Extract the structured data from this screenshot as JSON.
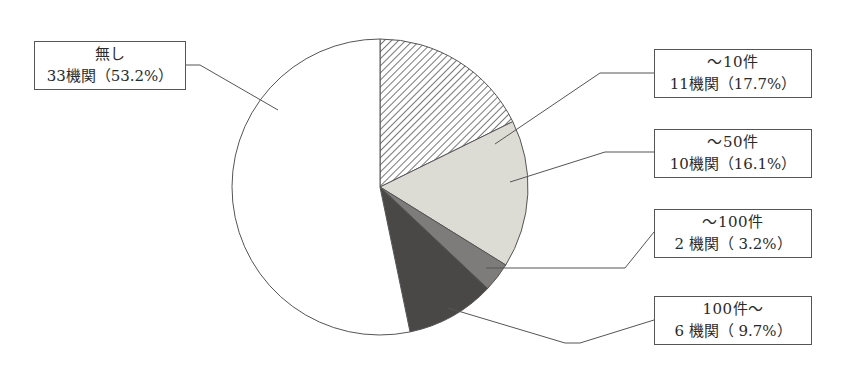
{
  "chart_data": {
    "type": "pie",
    "title": "",
    "start_angle_deg": 0,
    "direction": "clockwise",
    "slices": [
      {
        "label": "～10件",
        "count_text": "11機関（17.7%）",
        "count": 11,
        "percent": 17.7,
        "fill": "hatch",
        "color": "#ffffff"
      },
      {
        "label": "～50件",
        "count_text": "10機関（16.1%）",
        "count": 10,
        "percent": 16.1,
        "fill": "solid",
        "color": "#dcdcd4"
      },
      {
        "label": "～100件",
        "count_text": "2 機関（ 3.2%）",
        "count": 2,
        "percent": 3.2,
        "fill": "solid",
        "color": "#7e7c7b"
      },
      {
        "label": "100件～",
        "count_text": "6 機関（ 9.7%）",
        "count": 6,
        "percent": 9.7,
        "fill": "solid",
        "color": "#4a4747"
      },
      {
        "label": "無し",
        "count_text": "33機関（53.2%）",
        "count": 33,
        "percent": 53.2,
        "fill": "solid",
        "color": "#ffffff"
      }
    ],
    "total": 62,
    "legend": "callout-boxes"
  },
  "labels": {
    "none": {
      "line1": "無し",
      "line2": "33機関（53.2%）"
    },
    "upto10": {
      "line1": "～10件",
      "line2": "11機関（17.7%）"
    },
    "upto50": {
      "line1": "～50件",
      "line2": "10機関（16.1%）"
    },
    "upto100": {
      "line1": "～100件",
      "line2": "2 機関（ 3.2%）"
    },
    "over100": {
      "line1": "100件～",
      "line2": "6 機関（ 9.7%）"
    }
  },
  "colors": {
    "outline": "#555555",
    "hatch": "#555555",
    "light": "#dcdcd4",
    "medium": "#7e7c7b",
    "dark": "#4a4747"
  }
}
